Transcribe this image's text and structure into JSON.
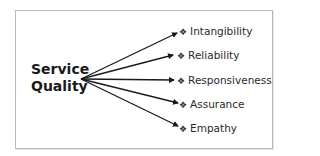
{
  "diagram": {
    "title_line1": "Service",
    "title_line2": "Quality",
    "bullet_glyph": "❖",
    "items": [
      {
        "label": "Intangibility"
      },
      {
        "label": "Reliability"
      },
      {
        "label": "Responsiveness"
      },
      {
        "label": "Assurance"
      },
      {
        "label": "Empathy"
      }
    ],
    "colors": {
      "arrow": "#1a1a1a",
      "border": "#b8b8b8",
      "text": "#2a2a2a"
    }
  }
}
